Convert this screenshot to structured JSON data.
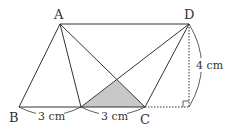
{
  "diagram": {
    "points": {
      "A": {
        "label": "A",
        "x": 60,
        "y": 24
      },
      "D": {
        "label": "D",
        "x": 189,
        "y": 24
      },
      "B": {
        "label": "B",
        "x": 19,
        "y": 107
      },
      "E": {
        "label": "",
        "x": 81,
        "y": 107
      },
      "C": {
        "label": "C",
        "x": 145,
        "y": 107
      },
      "H": {
        "label": "",
        "x": 189,
        "y": 107
      }
    },
    "measurements": {
      "BE": "3 cm",
      "EC": "3 cm",
      "DH": "4 cm"
    },
    "shaded_region_color": "#c8c8c8",
    "line_color": "#333333"
  }
}
